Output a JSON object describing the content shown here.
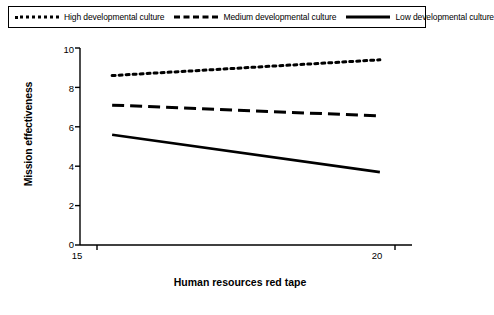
{
  "chart_data": {
    "type": "line",
    "title": "",
    "xlabel": "Human resources red tape",
    "ylabel": "Mission effectiveness",
    "x": [
      15,
      20
    ],
    "xlim": [
      14.4,
      20.6
    ],
    "ylim": [
      0,
      10
    ],
    "xticks": [
      "15",
      "20"
    ],
    "yticks": [
      "0",
      "2",
      "4",
      "6",
      "8",
      "10"
    ],
    "grid": false,
    "legend_position": "top",
    "series": [
      {
        "name": "High developmental culture",
        "style": "dotted",
        "values": [
          8.6,
          9.4
        ]
      },
      {
        "name": "Medium developmental culture",
        "style": "dashed",
        "values": [
          7.1,
          6.55
        ]
      },
      {
        "name": "Low developmental culture",
        "style": "solid",
        "values": [
          5.6,
          3.7
        ]
      }
    ]
  },
  "legend": {
    "entries": [
      {
        "label": "High developmental culture",
        "sample": "dotted-line-sample"
      },
      {
        "label": "Medium developmental culture",
        "sample": "dashed-line-sample"
      },
      {
        "label": "Low developmental culture",
        "sample": "solid-line-sample"
      }
    ]
  },
  "axes": {
    "y_title": "Mission effectiveness",
    "x_title": "Human resources red tape",
    "y_ticks": [
      "10",
      "8",
      "6",
      "4",
      "2",
      "0"
    ],
    "x_ticks": [
      "15",
      "20"
    ]
  }
}
